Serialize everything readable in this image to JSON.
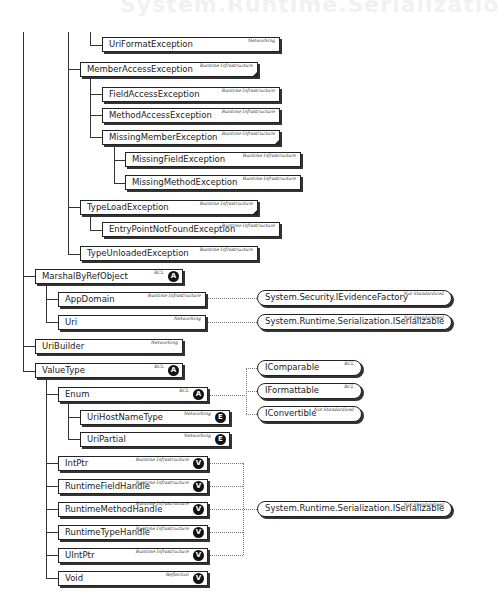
{
  "header": {
    "title": "System.Runtime.Serializatio"
  },
  "nodes": {
    "uri_format_exception": {
      "name": "UriFormatException",
      "tag": "Networking"
    },
    "member_access_exception": {
      "name": "MemberAccessException",
      "tag": "Runtime Infrastructure"
    },
    "field_access_exception": {
      "name": "FieldAccessException",
      "tag": "Runtime Infrastructure"
    },
    "method_access_exception": {
      "name": "MethodAccessException",
      "tag": "Runtime Infrastructure"
    },
    "missing_member_exception": {
      "name": "MissingMemberException",
      "tag": "Runtime Infrastructure"
    },
    "missing_field_exception": {
      "name": "MissingFieldException",
      "tag": "Runtime Infrastructure"
    },
    "missing_method_exception": {
      "name": "MissingMethodException",
      "tag": "Runtime Infrastructure"
    },
    "type_load_exception": {
      "name": "TypeLoadException",
      "tag": "Runtime Infrastructure"
    },
    "entry_point_not_found_exception": {
      "name": "EntryPointNotFoundException",
      "tag": "Runtime Infrastructure"
    },
    "type_unloaded_exception": {
      "name": "TypeUnloadedException",
      "tag": "Runtime Infrastructure"
    },
    "marshal_by_ref_object": {
      "name": "MarshalByRefObject",
      "tag": "BCL",
      "badge": "A"
    },
    "app_domain": {
      "name": "AppDomain",
      "tag": "Runtime Infrastructure"
    },
    "uri": {
      "name": "Uri",
      "tag": "Networking"
    },
    "uri_builder": {
      "name": "UriBuilder",
      "tag": "Networking"
    },
    "value_type": {
      "name": "ValueType",
      "tag": "BCL",
      "badge": "A"
    },
    "enum": {
      "name": "Enum",
      "tag": "BCL",
      "badge": "A"
    },
    "uri_host_name_type": {
      "name": "UriHostNameType",
      "tag": "Networking",
      "badge": "E"
    },
    "uri_partial": {
      "name": "UriPartial",
      "tag": "Networking",
      "badge": "E"
    },
    "int_ptr": {
      "name": "IntPtr",
      "tag": "Runtime Infrastructure",
      "badge": "V"
    },
    "runtime_field_handle": {
      "name": "RuntimeFieldHandle",
      "tag": "Runtime Infrastructure",
      "badge": "V"
    },
    "runtime_method_handle": {
      "name": "RuntimeMethodHandle",
      "tag": "Runtime Infrastructure",
      "badge": "V"
    },
    "runtime_type_handle": {
      "name": "RuntimeTypeHandle",
      "tag": "Runtime Infrastructure",
      "badge": "V"
    },
    "uint_ptr": {
      "name": "UIntPtr",
      "tag": "Runtime Infrastructure",
      "badge": "V"
    },
    "void": {
      "name": "Void",
      "tag": "Reflection",
      "badge": "V"
    }
  },
  "interfaces": {
    "ievidence_factory": {
      "name": "System.Security.IEvidenceFactory",
      "tag": "Not Standardized"
    },
    "iserializable_uri": {
      "name": "System.Runtime.Serialization.ISerializable",
      "tag": "Not Standardized"
    },
    "icomparable": {
      "name": "IComparable",
      "tag": "BCL"
    },
    "iformattable": {
      "name": "IFormattable",
      "tag": "BCL"
    },
    "iconvertible": {
      "name": "IConvertible",
      "tag": "Not Standardized"
    },
    "iserializable_handles": {
      "name": "System.Runtime.Serialization.ISerializable",
      "tag": "Not Standardized"
    }
  }
}
